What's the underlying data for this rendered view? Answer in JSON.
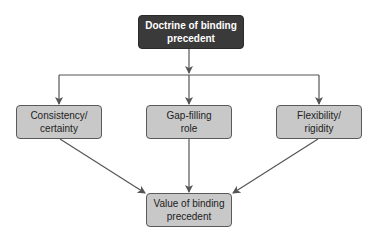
{
  "diagram": {
    "top": {
      "label_line1": "Doctrine of binding",
      "label_line2": "precedent"
    },
    "middle": [
      {
        "label_line1": "Consistency/",
        "label_line2": "certainty"
      },
      {
        "label_line1": "Gap-filling",
        "label_line2": "role"
      },
      {
        "label_line1": "Flexibility/",
        "label_line2": "rigidity"
      }
    ],
    "bottom": {
      "label_line1": "Value of binding",
      "label_line2": "precedent"
    },
    "colors": {
      "top_fill": "#3a3a3a",
      "node_fill": "#c8c8c8",
      "line": "#555555"
    },
    "edges": [
      {
        "from": "Doctrine of binding precedent",
        "to": "Consistency/certainty"
      },
      {
        "from": "Doctrine of binding precedent",
        "to": "Gap-filling role"
      },
      {
        "from": "Doctrine of binding precedent",
        "to": "Flexibility/rigidity"
      },
      {
        "from": "Consistency/certainty",
        "to": "Value of binding precedent"
      },
      {
        "from": "Gap-filling role",
        "to": "Value of binding precedent"
      },
      {
        "from": "Flexibility/rigidity",
        "to": "Value of binding precedent"
      }
    ]
  }
}
